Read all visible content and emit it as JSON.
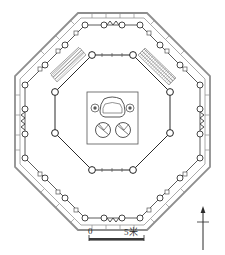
{
  "figure": {
    "type": "architectural-floor-plan",
    "background_color": "#ffffff",
    "ink_color": "#3a3a3a",
    "light_ink_color": "#9a9a9a"
  },
  "scale_bar": {
    "zero_label": "0",
    "max_label": "5米",
    "unit": "米",
    "max_value": "5",
    "bar_color": "#3a3a3a"
  },
  "north_arrow": {
    "label": "",
    "direction": "up"
  },
  "structures": {
    "outer_wall": {
      "name": "outer octagonal enclosure wall",
      "sides": 8,
      "style": "double-line",
      "color": "#8a8a8a"
    },
    "veranda_colonnade": {
      "name": "outer colonnade ring",
      "sides": 8,
      "column_shape": "circle",
      "column_count": 24,
      "color": "#3a3a3a"
    },
    "inner_octagon": {
      "name": "inner octagonal chamber",
      "sides": 8,
      "column_shape": "circle",
      "column_count": 8,
      "color": "#2b2b2b"
    },
    "central_platform": {
      "name": "central altar platform",
      "shape": "rectangle",
      "features": [
        {
          "name": "altar-base",
          "shape": "rounded-trapezoid"
        },
        {
          "name": "small-column-left",
          "shape": "double-circle"
        },
        {
          "name": "small-column-right",
          "shape": "double-circle"
        },
        {
          "name": "pedestal-lower-left",
          "shape": "circle-with-notch"
        },
        {
          "name": "pedestal-lower-right",
          "shape": "circle-with-notch"
        }
      ]
    },
    "stairs": [
      {
        "name": "northwest-stair",
        "hatch": "diagonal-lines"
      },
      {
        "name": "northeast-stair",
        "hatch": "diagonal-lines"
      }
    ],
    "railings": [
      {
        "name": "north-railing",
        "pattern": "zigzag"
      },
      {
        "name": "south-railing",
        "pattern": "zigzag"
      },
      {
        "name": "east-railing",
        "pattern": "zigzag"
      },
      {
        "name": "west-railing",
        "pattern": "zigzag"
      }
    ]
  }
}
